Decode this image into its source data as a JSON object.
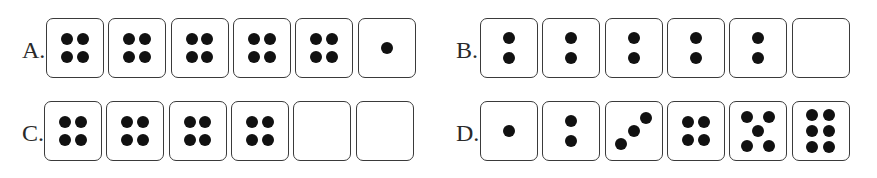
{
  "options": [
    {
      "label": "A.",
      "dice": [
        4,
        4,
        4,
        4,
        4,
        1
      ]
    },
    {
      "label": "B.",
      "dice": [
        2,
        2,
        2,
        2,
        2,
        0
      ]
    },
    {
      "label": "C.",
      "dice": [
        4,
        4,
        4,
        4,
        0,
        0
      ]
    },
    {
      "label": "D.",
      "dice": [
        1,
        2,
        3,
        4,
        5,
        6
      ]
    }
  ],
  "colors": {
    "pip": "#111111",
    "border": "#3a3a3a",
    "text": "#2a2a2a"
  }
}
